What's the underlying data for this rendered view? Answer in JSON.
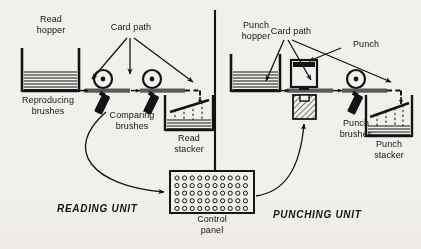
{
  "figure": {
    "background_color": "#f2f0ec",
    "ink_color": "#141414"
  },
  "divider": {
    "name": "unit-divider-line"
  },
  "units": [
    {
      "id": "reading",
      "label": "READING UNIT"
    },
    {
      "id": "punching",
      "label": "PUNCHING UNIT"
    }
  ],
  "labels": {
    "read_hopper": "Read\nhopper",
    "card_path_left": "Card path",
    "reproducing_brushes": "Reproducing\nbrushes",
    "comparing_brushes": "Comparing\nbrushes",
    "read_stacker": "Read\nstacker",
    "punch_hopper": "Punch\nhopper",
    "card_path_right": "Card path",
    "punch": "Punch",
    "punch_brushes": "Punch\nbrushes",
    "punch_stacker": "Punch\nstacker",
    "control_panel": "Control\npanel"
  },
  "components": {
    "read_hopper": {
      "name": "read-hopper",
      "card_lines": 7
    },
    "punch_hopper": {
      "name": "punch-hopper",
      "card_lines": 7
    },
    "read_stacker": {
      "name": "read-stacker",
      "card_lines": 6,
      "drop_arrows": 1
    },
    "punch_stacker": {
      "name": "punch-stacker",
      "card_lines": 5,
      "drop_arrows": 1
    },
    "rollers": {
      "name": "feed-roller",
      "count_reading": 2,
      "count_punching": 1
    },
    "brushes": {
      "name": "brush-assembly",
      "count_reading": 2,
      "count_punching": 1
    },
    "punch_die": {
      "name": "punch-die-block",
      "hatched": true
    },
    "punch_head": {
      "name": "punch-head-block"
    },
    "control_panel": {
      "name": "control-panel",
      "hole_columns": 10,
      "hole_rows": 5
    }
  },
  "arrows": {
    "card_path_fan_left": 3,
    "card_path_fan_right": 3,
    "punch_leader": 1,
    "control_to_reading": 1,
    "control_to_punching": 1,
    "feed_arrows": 4
  }
}
